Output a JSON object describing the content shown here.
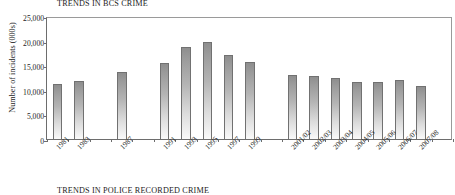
{
  "chart_data": {
    "type": "bar",
    "title": "TRENDS IN BCS CRIME",
    "xlabel": "",
    "ylabel": "Number of incidents (000s)",
    "ylim": [
      0,
      25000
    ],
    "yticks": [
      0,
      5000,
      10000,
      15000,
      20000,
      25000
    ],
    "ytick_labels": [
      "0",
      "5,000",
      "10,000",
      "15,000",
      "20,000",
      "25,000"
    ],
    "grid": false,
    "legend": "none",
    "categories": [
      "1981",
      "1983",
      "1987",
      "1991",
      "1993",
      "1995",
      "1997",
      "1999",
      "2001/02",
      "2002/03",
      "2003/04",
      "2004/05",
      "2005/06",
      "2006/07",
      "2007/08"
    ],
    "values": [
      11100,
      11800,
      13600,
      15400,
      18800,
      19800,
      17100,
      15600,
      13000,
      12850,
      12300,
      11650,
      11600,
      12050,
      10850
    ],
    "slot_count": 19,
    "slot_index": [
      0,
      1,
      3,
      5,
      6,
      7,
      8,
      9,
      11,
      12,
      13,
      14,
      15,
      16,
      17
    ],
    "bar_color": "#a9a9a9",
    "bar_edge_color": "#717171",
    "axis_color": "#6d6d6d"
  },
  "caption": {
    "bottom_text": "TRENDS IN POLICE RECORDED CRIME"
  }
}
